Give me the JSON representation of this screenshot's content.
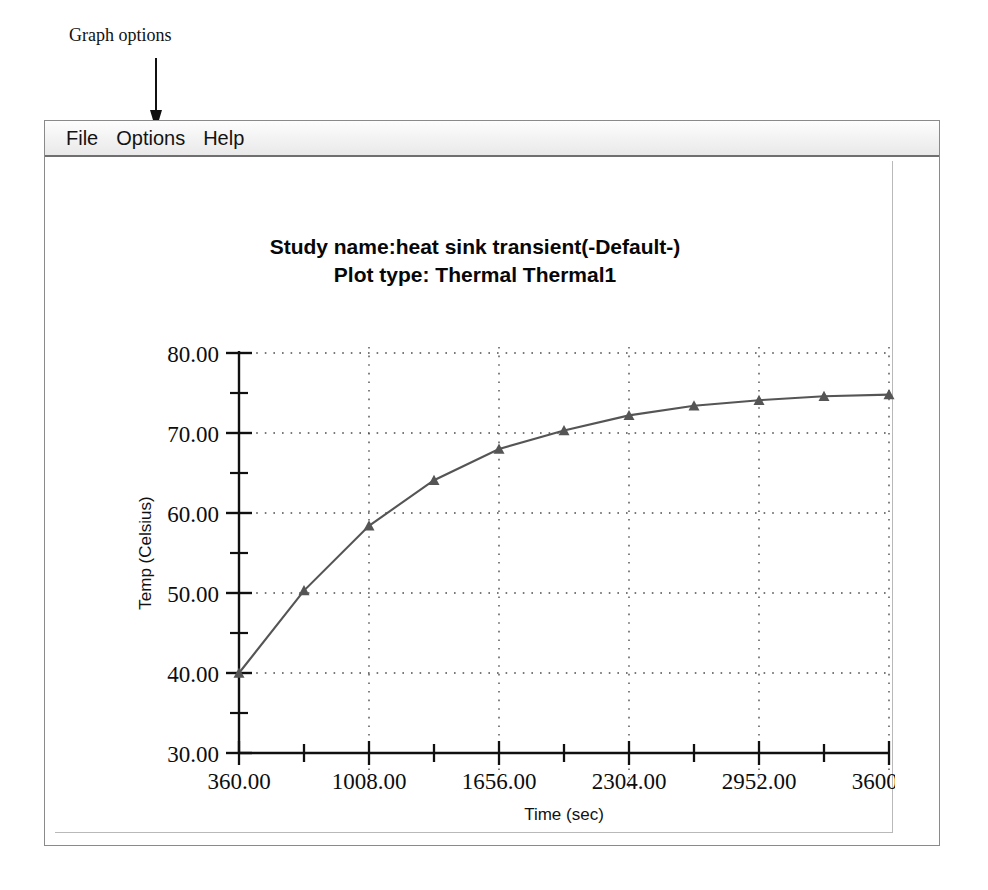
{
  "annotation": {
    "label": "Graph options",
    "arrow_icon": "down-arrow-icon"
  },
  "window": {
    "menubar": {
      "items": [
        {
          "label": "File"
        },
        {
          "label": "Options"
        },
        {
          "label": "Help"
        }
      ]
    }
  },
  "chart_data": {
    "type": "line",
    "title_lines": [
      "Study name:heat sink transient(-Default-)",
      "Plot type: Thermal Thermal1"
    ],
    "xlabel": "Time (sec)",
    "ylabel": "Temp (Celsius)",
    "xlim": [
      360,
      3600
    ],
    "ylim": [
      30,
      80
    ],
    "xticks": [
      360,
      1008,
      1656,
      2304,
      2952,
      3600
    ],
    "xtick_labels": [
      "360.00",
      "1008.00",
      "1656.00",
      "2304.00",
      "2952.00",
      "3600.00"
    ],
    "yticks": [
      30,
      40,
      50,
      60,
      70,
      80
    ],
    "ytick_labels": [
      "30.00",
      "40.00",
      "50.00",
      "60.00",
      "70.00",
      "80.00"
    ],
    "x_minor_interval": 324,
    "y_minor_interval": 5,
    "grid": true,
    "grid_style": "dotted",
    "legend": false,
    "series": [
      {
        "name": "Thermal1",
        "marker": "triangle",
        "color": "#555555",
        "x": [
          360,
          684,
          1008,
          1332,
          1656,
          1980,
          2304,
          2628,
          2952,
          3276,
          3600
        ],
        "y": [
          40.0,
          50.3,
          58.4,
          64.1,
          68.0,
          70.3,
          72.2,
          73.4,
          74.1,
          74.6,
          74.8
        ]
      }
    ]
  }
}
